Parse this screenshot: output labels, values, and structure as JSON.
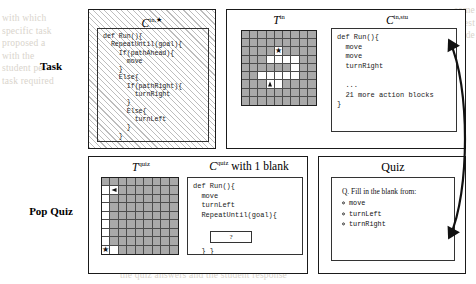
{
  "figure": {
    "rows": [
      {
        "label": "Task"
      },
      {
        "label": "Pop Quiz"
      }
    ]
  },
  "task_row": {
    "hidden_code_card": {
      "title_base": "C",
      "title_sup": "in,★",
      "code": "def Run(){\n  RepeatUntil(goal){\n    If(pathAhead){\n      move\n    }\n    Else{\n      If(pathRight){\n        turnRight\n      }\n      Else{\n        turnLeft\n      }\n    }\n  }\n}"
    },
    "task_grid": {
      "title_base": "T",
      "title_sup": "in",
      "rows": 9,
      "cols": 9,
      "open_cells": [
        [
          2,
          4
        ],
        [
          3,
          3
        ],
        [
          3,
          4
        ],
        [
          3,
          5
        ],
        [
          3,
          6
        ],
        [
          4,
          6
        ],
        [
          5,
          2
        ],
        [
          5,
          3
        ],
        [
          5,
          4
        ],
        [
          5,
          5
        ],
        [
          5,
          6
        ],
        [
          6,
          3
        ],
        [
          6,
          4
        ]
      ],
      "goal": {
        "row": 2,
        "col": 4,
        "glyph": "★",
        "name": "goal-star"
      },
      "robot": {
        "row": 6,
        "col": 3,
        "dir": "up",
        "name": "robot-marker"
      }
    },
    "student_code_card": {
      "title_base": "C",
      "title_sup": "in,stu",
      "code": "def Run(){\n  move\n  move\n  turnRight\n\n  ...\n  21 more action blocks\n}",
      "code_lines": [
        "def Run(){",
        "  move",
        "  move",
        "  turnRight",
        "",
        "  ...",
        "  21 more action blocks",
        "}"
      ]
    }
  },
  "popquiz_row": {
    "quiz_grid": {
      "title_base": "T",
      "title_sup": "quiz",
      "rows": 9,
      "cols": 9,
      "open_cells": [
        [
          1,
          0
        ],
        [
          1,
          1
        ],
        [
          2,
          0
        ],
        [
          3,
          0
        ],
        [
          4,
          0
        ],
        [
          5,
          0
        ],
        [
          6,
          0
        ],
        [
          7,
          0
        ],
        [
          8,
          0
        ],
        [
          8,
          1
        ]
      ],
      "robot": {
        "row": 1,
        "col": 1,
        "dir": "left",
        "name": "robot-marker"
      },
      "goal": {
        "row": 8,
        "col": 0,
        "glyph": "★",
        "name": "goal-star"
      }
    },
    "quiz_code_card": {
      "title_base": "C",
      "title_sup": "quiz",
      "title_suffix": " with 1 blank",
      "code_before": "def Run(){\n  move\n  turnLeft\n  RepeatUntil(goal){",
      "blank_label": "?",
      "code_after": "  } }"
    },
    "quiz_card": {
      "title": "Quiz",
      "question": "Q. Fill in the blank from:",
      "options": [
        "move",
        "turnLeft",
        "turnRight"
      ]
    }
  },
  "connector": {
    "name": "double-headed-curved-arrow"
  },
  "bleed": {
    "left": "with which\nspecific task\nproposed a\nwith the\nstudent per-\ntask required",
    "right": "some\ntest\ncode",
    "bottom": "the quiz answers and the student response"
  }
}
